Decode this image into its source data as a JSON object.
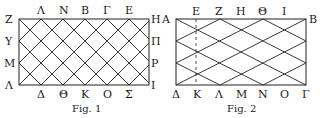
{
  "figures": [
    {
      "caption": "Fig. 1",
      "corners": {
        "top_left": "Z",
        "top_right": "H",
        "bottom_left": "Λ",
        "bottom_right": "I"
      },
      "top_labels": [
        "Λ",
        "N",
        "B",
        "Γ",
        "E"
      ],
      "bottom_labels": [
        "Δ",
        "Θ",
        "K",
        "O",
        "Σ"
      ],
      "left_labels": [
        "Υ",
        "M"
      ],
      "right_labels": [
        "Π",
        "P"
      ]
    },
    {
      "caption": "Fig. 2",
      "corners": {
        "top_left": "A",
        "top_right": "B",
        "bottom_left": "Δ",
        "bottom_right": "Γ"
      },
      "top_labels": [
        "E",
        "Z",
        "H",
        "Θ",
        "I"
      ],
      "bottom_labels": [
        "K",
        "Λ",
        "M",
        "N",
        "O"
      ]
    }
  ]
}
